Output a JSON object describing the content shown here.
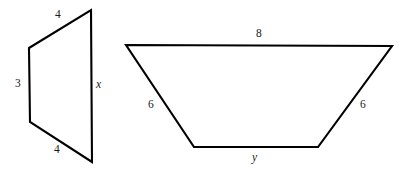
{
  "figure": {
    "background_color": "#ffffff",
    "stroke_color": "#000000",
    "label_color": "#1a1a1a",
    "shapes": [
      {
        "id": "left-quadrilateral",
        "name": "left-quadrilateral",
        "kind": "trapezoid",
        "points": "29,48 91,10 92,162 30,122",
        "labels": [
          {
            "id": "top",
            "text": "4",
            "kind": "number",
            "x": 55,
            "y": 9,
            "side": "top-slanted"
          },
          {
            "id": "left",
            "text": "3",
            "kind": "number",
            "x": 15,
            "y": 78,
            "side": "left-vertical"
          },
          {
            "id": "right",
            "text": "x",
            "kind": "variable",
            "x": 96,
            "y": 79,
            "side": "right-vertical"
          },
          {
            "id": "bottom",
            "text": "4",
            "kind": "number",
            "x": 54,
            "y": 144,
            "side": "bottom-slanted"
          }
        ]
      },
      {
        "id": "right-trapezoid",
        "name": "right-trapezoid",
        "kind": "isosceles-trapezoid",
        "points": "126,45 392,46 318,147 194,147",
        "labels": [
          {
            "id": "top",
            "text": "8",
            "kind": "number",
            "x": 256,
            "y": 28,
            "side": "top-horizontal"
          },
          {
            "id": "left-leg",
            "text": "6",
            "kind": "number",
            "x": 148,
            "y": 99,
            "side": "left-slanted"
          },
          {
            "id": "right-leg",
            "text": "6",
            "kind": "number",
            "x": 360,
            "y": 99,
            "side": "right-slanted"
          },
          {
            "id": "bottom",
            "text": "y",
            "kind": "variable",
            "x": 252,
            "y": 152,
            "side": "bottom-horizontal"
          }
        ]
      }
    ]
  }
}
